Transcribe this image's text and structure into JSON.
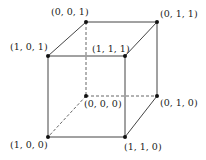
{
  "diagram": {
    "type": "unit-cube",
    "vertices": [
      {
        "id": "v001",
        "label": "(0, 0, 1)",
        "x": 86,
        "y": 22,
        "lx": 51,
        "ly": 15
      },
      {
        "id": "v011",
        "label": "(0, 1, 1)",
        "x": 157,
        "y": 22,
        "lx": 160,
        "ly": 17
      },
      {
        "id": "v101",
        "label": "(1, 0, 1)",
        "x": 48,
        "y": 56,
        "lx": 10,
        "ly": 50
      },
      {
        "id": "v111",
        "label": "(1, 1, 1)",
        "x": 125,
        "y": 56,
        "lx": 92,
        "ly": 52
      },
      {
        "id": "v000",
        "label": "(0, 0, 0)",
        "x": 86,
        "y": 96,
        "lx": 84,
        "ly": 107
      },
      {
        "id": "v010",
        "label": "(0, 1, 0)",
        "x": 157,
        "y": 96,
        "lx": 160,
        "ly": 106
      },
      {
        "id": "v100",
        "label": "(1, 0, 0)",
        "x": 48,
        "y": 137,
        "lx": 10,
        "ly": 148
      },
      {
        "id": "v110",
        "label": "(1, 1, 0)",
        "x": 125,
        "y": 137,
        "lx": 124,
        "ly": 150
      }
    ],
    "edges_solid": [
      [
        "v101",
        "v111"
      ],
      [
        "v101",
        "v100"
      ],
      [
        "v100",
        "v110"
      ],
      [
        "v111",
        "v110"
      ],
      [
        "v001",
        "v011"
      ],
      [
        "v011",
        "v010"
      ],
      [
        "v101",
        "v001"
      ],
      [
        "v111",
        "v011"
      ],
      [
        "v110",
        "v010"
      ]
    ],
    "edges_hidden": [
      [
        "v001",
        "v000"
      ],
      [
        "v000",
        "v010"
      ],
      [
        "v000",
        "v100"
      ]
    ]
  }
}
